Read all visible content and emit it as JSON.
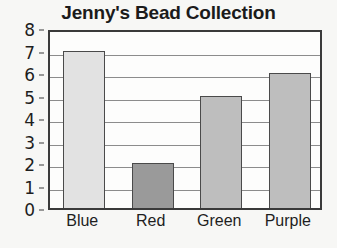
{
  "chart_data": {
    "type": "bar",
    "title": "Jenny's Bead Collection",
    "xlabel": "",
    "ylabel": "",
    "categories": [
      "Blue",
      "Red",
      "Green",
      "Purple"
    ],
    "values": [
      7,
      2,
      5,
      6
    ],
    "series": [
      {
        "name": "Beads",
        "values": [
          7,
          2,
          5,
          6
        ]
      }
    ],
    "bar_colors": [
      "#e2e2e2",
      "#9a9a9a",
      "#bebebe",
      "#bebebe"
    ],
    "bar_outline_color": "#4a4a4a",
    "ylim": [
      0,
      8
    ],
    "ytick_labels": [
      "0",
      "1",
      "2",
      "3",
      "4",
      "5",
      "6",
      "7",
      "8"
    ],
    "ytick_values": [
      0,
      1,
      2,
      3,
      4,
      5,
      6,
      7,
      8
    ],
    "grid": true,
    "grid_color": "#8c8c8c",
    "legend": "none",
    "frame_color": "#3a3a3a",
    "plot_background": "#fdfdfc",
    "page_background": "#f7f7f5"
  }
}
